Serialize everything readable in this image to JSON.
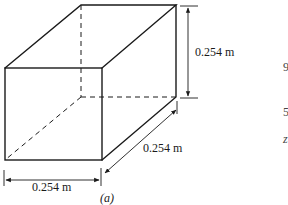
{
  "figure": {
    "caption": "(a)",
    "shape": "rectangular box (cube) in oblique projection",
    "line_color": "#1a1a1a",
    "background": "#ffffff",
    "dimensions": {
      "height_label": "0.254 m",
      "width_label": "0.254 m",
      "depth_label": "0.254 m"
    },
    "edge_fragments": [
      "9",
      "5",
      "z"
    ]
  }
}
